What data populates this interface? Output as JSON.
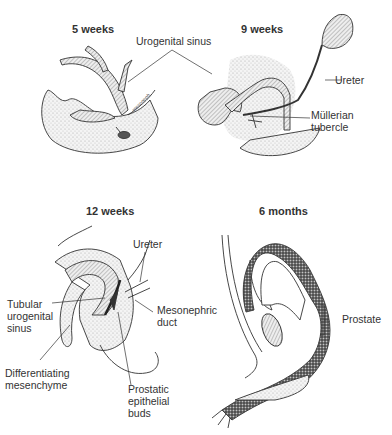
{
  "panels": [
    {
      "id": "5-weeks",
      "title": "5 weeks"
    },
    {
      "id": "9-weeks",
      "title": "9 weeks"
    },
    {
      "id": "12-weeks",
      "title": "12 weeks"
    },
    {
      "id": "6-months",
      "title": "6 months"
    }
  ],
  "labels": {
    "urogenital_sinus": "Urogenital sinus",
    "ureter_9w": "Ureter",
    "mullerian_line1": "Müllerian",
    "mullerian_line2": "tubercle",
    "ureter_12w": "Ureter",
    "tubular_line1": "Tubular",
    "tubular_line2": "urogenital",
    "tubular_line3": "sinus",
    "mesonephric_line1": "Mesonephric",
    "mesonephric_line2": "duct",
    "differentiating_line1": "Differentiating",
    "differentiating_line2": "mesenchyme",
    "prostatic_line1": "Prostatic",
    "prostatic_line2": "epithelial",
    "prostatic_line3": "buds",
    "prostate": "Prostate"
  },
  "colors": {
    "ink": "#333333",
    "stipple": "#d8d8d8",
    "dense": "#555555"
  }
}
